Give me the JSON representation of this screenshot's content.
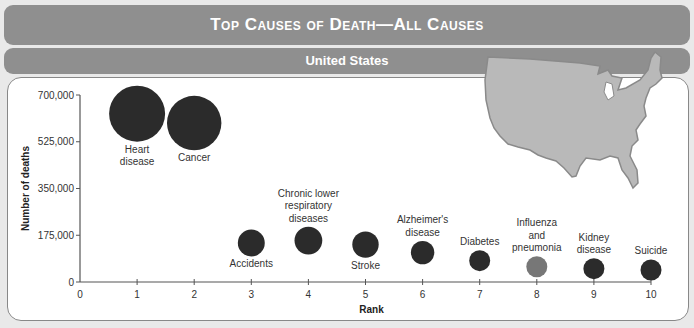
{
  "header": {
    "title": "Top Causes of Death—All Causes",
    "subtitle": "United States"
  },
  "colors": {
    "banner": "#8f8f8f",
    "bubble": "#2b2b2b",
    "bubble_highlight": "#777777",
    "map": "#b9b9b9"
  },
  "chart_data": {
    "type": "scatter",
    "title": "Top Causes of Death—All Causes",
    "subtitle": "United States",
    "xlabel": "Rank",
    "ylabel": "Number of deaths",
    "xlim": [
      0,
      10
    ],
    "ylim": [
      0,
      700000
    ],
    "x_ticks": [
      "0",
      "1",
      "2",
      "3",
      "4",
      "5",
      "6",
      "7",
      "8",
      "9",
      "10"
    ],
    "y_ticks": [
      "0",
      "175,000",
      "350,000",
      "525,000",
      "700,000"
    ],
    "grid": false,
    "bubble_size_encodes": "Number of deaths",
    "points": [
      {
        "rank": 1,
        "label": [
          "Heart",
          "disease"
        ],
        "value": 630000,
        "label_pos": "below"
      },
      {
        "rank": 2,
        "label": [
          "Cancer"
        ],
        "value": 595000,
        "label_pos": "below"
      },
      {
        "rank": 3,
        "label": [
          "Accidents"
        ],
        "value": 146000,
        "label_pos": "below"
      },
      {
        "rank": 4,
        "label": [
          "Chronic lower",
          "respiratory",
          "diseases"
        ],
        "value": 155000,
        "label_pos": "above"
      },
      {
        "rank": 5,
        "label": [
          "Stroke"
        ],
        "value": 140000,
        "label_pos": "below"
      },
      {
        "rank": 6,
        "label": [
          "Alzheimer's",
          "disease"
        ],
        "value": 110000,
        "label_pos": "above"
      },
      {
        "rank": 7,
        "label": [
          "Diabetes"
        ],
        "value": 80000,
        "label_pos": "above"
      },
      {
        "rank": 8,
        "label": [
          "Influenza",
          "and",
          "pneumonia"
        ],
        "value": 57000,
        "label_pos": "above",
        "highlight": true
      },
      {
        "rank": 9,
        "label": [
          "Kidney",
          "disease"
        ],
        "value": 50000,
        "label_pos": "above"
      },
      {
        "rank": 10,
        "label": [
          "Suicide"
        ],
        "value": 45000,
        "label_pos": "above"
      }
    ]
  }
}
